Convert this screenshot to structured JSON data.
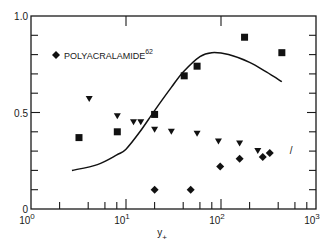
{
  "chart_data": {
    "type": "scatter",
    "title": "",
    "xlabel": "y+",
    "xlabel_main": "y",
    "xlabel_sub": "+",
    "ylabel": "",
    "xscale": "log",
    "xlim": [
      1,
      1000
    ],
    "ylim": [
      0,
      1.0
    ],
    "x_ticks": [
      {
        "base": "10",
        "exp": "0"
      },
      {
        "base": "10",
        "exp": "1"
      },
      {
        "base": "10",
        "exp": "2"
      },
      {
        "base": "10",
        "exp": "3"
      }
    ],
    "y_ticks": [
      "0",
      "0.5",
      "1.0"
    ],
    "y_minor_ticks": [
      0.1,
      0.2,
      0.3,
      0.4,
      0.6,
      0.7,
      0.8,
      0.9
    ],
    "legend": {
      "placement": "top-left",
      "entries": [
        {
          "marker": "diamond",
          "text": "POLYACRALAMIDE",
          "superscript": "62"
        }
      ]
    },
    "series": [
      {
        "name": "squares",
        "marker": "square",
        "points": [
          [
            3.2,
            0.37
          ],
          [
            8.1,
            0.4
          ],
          [
            20,
            0.49
          ],
          [
            41,
            0.69
          ],
          [
            56,
            0.74
          ],
          [
            177,
            0.89
          ],
          [
            437,
            0.81
          ]
        ]
      },
      {
        "name": "triangles",
        "marker": "triangle-down",
        "points": [
          [
            4.1,
            0.57
          ],
          [
            8.1,
            0.48
          ],
          [
            12,
            0.45
          ],
          [
            14.3,
            0.45
          ],
          [
            20,
            0.41
          ],
          [
            30,
            0.4
          ],
          [
            56,
            0.39
          ],
          [
            94,
            0.35
          ],
          [
            157,
            0.34
          ],
          [
            244,
            0.3
          ]
        ]
      },
      {
        "name": "POLYACRALAMIDE",
        "marker": "diamond",
        "points": [
          [
            20,
            0.1
          ],
          [
            48,
            0.1
          ],
          [
            98,
            0.22
          ],
          [
            157,
            0.26
          ],
          [
            275,
            0.27
          ],
          [
            326,
            0.29
          ]
        ]
      },
      {
        "name": "curve",
        "type": "line",
        "points": [
          [
            2.7,
            0.2
          ],
          [
            5,
            0.23
          ],
          [
            8,
            0.28
          ],
          [
            10,
            0.31
          ],
          [
            14,
            0.4
          ],
          [
            20,
            0.51
          ],
          [
            30,
            0.63
          ],
          [
            40,
            0.71
          ],
          [
            60,
            0.79
          ],
          [
            80,
            0.81
          ],
          [
            120,
            0.8
          ],
          [
            200,
            0.76
          ],
          [
            300,
            0.71
          ],
          [
            437,
            0.66
          ]
        ]
      }
    ],
    "annotations": [
      {
        "text": "/",
        "x": 530,
        "y": 0.3
      }
    ]
  }
}
